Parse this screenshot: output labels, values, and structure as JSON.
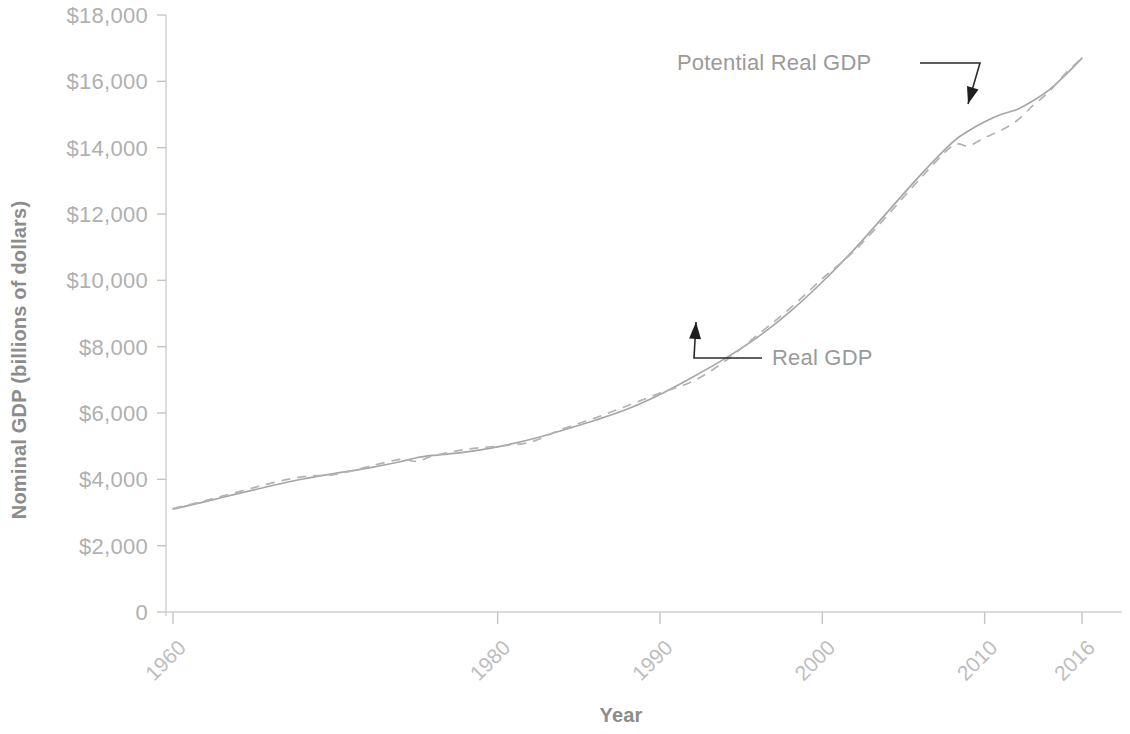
{
  "chart_data": {
    "type": "line",
    "title": "",
    "xlabel": "Year",
    "ylabel": "Nominal GDP (billions of dollars)",
    "xlim": [
      1960,
      2016
    ],
    "ylim": [
      0,
      18000
    ],
    "grid": false,
    "legend_position": "inline-annotations",
    "x_ticks": [
      1960,
      1980,
      1990,
      2000,
      2010,
      2016
    ],
    "x_tick_labels": [
      "1960",
      "1980",
      "1990",
      "2000",
      "2010",
      "2016"
    ],
    "y_ticks": [
      0,
      2000,
      4000,
      6000,
      8000,
      10000,
      12000,
      14000,
      16000,
      18000
    ],
    "y_tick_labels": [
      "0",
      "$2,000",
      "$4,000",
      "$6,000",
      "$8,000",
      "$10,000",
      "$12,000",
      "$14,000",
      "$16,000",
      "$18,000"
    ],
    "x": [
      1960,
      1962,
      1964,
      1966,
      1968,
      1970,
      1972,
      1974,
      1975,
      1976,
      1978,
      1980,
      1982,
      1984,
      1986,
      1988,
      1990,
      1992,
      1994,
      1996,
      1998,
      2000,
      2002,
      2004,
      2006,
      2008,
      2009,
      2010,
      2011,
      2012,
      2013,
      2014,
      2015,
      2016
    ],
    "series": [
      {
        "name": "Potential Real GDP",
        "style": "solid",
        "color": "#a6a6a6",
        "values": [
          3100,
          3330,
          3570,
          3800,
          4010,
          4180,
          4340,
          4530,
          4650,
          4720,
          4820,
          4980,
          5200,
          5480,
          5780,
          6120,
          6560,
          7080,
          7640,
          8280,
          9050,
          9950,
          10950,
          12050,
          13150,
          14150,
          14500,
          14780,
          15000,
          15150,
          15420,
          15750,
          16200,
          16700
        ]
      },
      {
        "name": "Real GDP",
        "style": "dashed",
        "color": "#b3b3b3",
        "values": [
          3120,
          3360,
          3620,
          3880,
          4080,
          4150,
          4380,
          4600,
          4540,
          4700,
          4900,
          5000,
          5120,
          5520,
          5850,
          6220,
          6600,
          6950,
          7560,
          8350,
          9150,
          10050,
          10900,
          11950,
          13050,
          14050,
          14050,
          14300,
          14520,
          14820,
          15280,
          15700,
          16250,
          16700
        ]
      }
    ],
    "annotations": [
      {
        "text": "Potential Real GDP",
        "label_x": 677,
        "label_y": 70,
        "target_x": 968,
        "target_y": 104
      },
      {
        "text": "Real GDP",
        "label_x": 772,
        "label_y": 365,
        "target_x": 696,
        "target_y": 322
      }
    ]
  },
  "axes": {
    "y_title": "Nominal GDP (billions of dollars)",
    "x_title": "Year"
  },
  "colors": {
    "potential_line": "#a6a6a6",
    "real_line": "#b3b3b3",
    "axis": "#cfcfcf",
    "tick_text": "#b0b0b0",
    "title_text": "#8c8c8c",
    "annotation_text": "#9a9a9a",
    "leader_line": "#1f1f1f",
    "background": "#ffffff"
  }
}
